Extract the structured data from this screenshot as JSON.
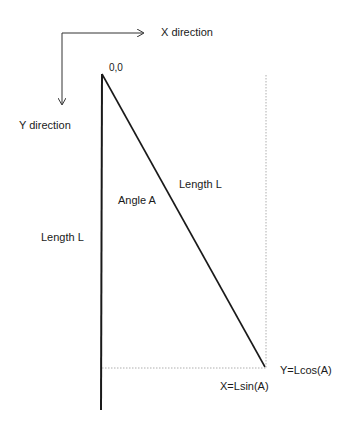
{
  "diagram": {
    "axes": {
      "x_label": "X direction",
      "y_label": "Y direction"
    },
    "origin_label": "0,0",
    "angle_label": "Angle A",
    "vertical_length_label": "Length L",
    "hypotenuse_length_label": "Length L",
    "x_projection_label": "X=Lsin(A)",
    "y_projection_label": "Y=Lcos(A)",
    "colors": {
      "line": "#1a1a1a",
      "dotted": "#9a9a9a",
      "background": "#ffffff"
    }
  }
}
